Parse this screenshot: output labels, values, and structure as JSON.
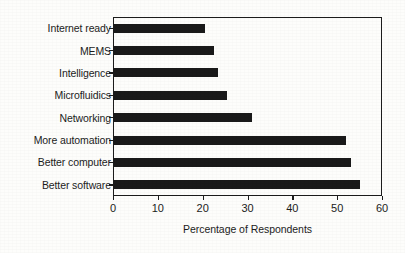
{
  "chart_data": {
    "type": "bar",
    "orientation": "horizontal",
    "title": "",
    "xlabel": "Percentage of Respondents",
    "ylabel": "",
    "categories": [
      "Internet ready",
      "MEMS",
      "Intelligence",
      "Microfluidics",
      "Networking",
      "More automation",
      "Better computer",
      "Better software"
    ],
    "values": [
      20.5,
      22.5,
      23.5,
      25.5,
      31,
      52,
      53,
      55
    ],
    "xlim": [
      0,
      60
    ],
    "xticks": [
      0,
      10,
      20,
      30,
      40,
      50,
      60
    ],
    "xtick_labels": [
      "0",
      "10",
      "20",
      "30",
      "40",
      "50",
      "60"
    ],
    "grid": false,
    "legend": false,
    "bar_color": "#1a1a1a",
    "background_color": "#fdfdfb",
    "axis_color": "#1c1c1c"
  }
}
